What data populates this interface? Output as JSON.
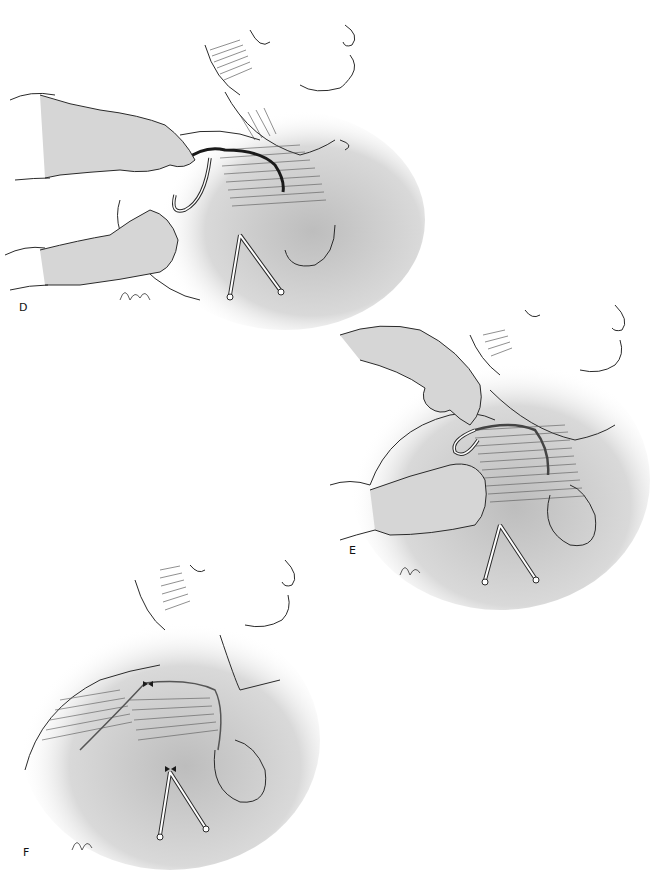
{
  "figure": {
    "panels": [
      {
        "id": "D",
        "label": "D",
        "description": "Two gloved hands pass a curved tunneling instrument subcutaneously from the chest incision toward the shoulder; a Y-shaped drain exits the lower sternal area."
      },
      {
        "id": "E",
        "label": "E",
        "description": "A hand pulls a looped catheter out through the shoulder exit site while the other hand stabilizes the tissue; Y-drain remains at the chest."
      },
      {
        "id": "F",
        "label": "F",
        "description": "Final result: incisions closed with sutures at the shoulder and sternal exit points; catheter tunneled under the skin; Y-drain in place."
      }
    ],
    "signature": "Glen",
    "colors": {
      "line": "#2a2a2a",
      "shade": "#c8c8c8",
      "background": "#ffffff",
      "catheter_dark": "#1a1a1a"
    }
  }
}
